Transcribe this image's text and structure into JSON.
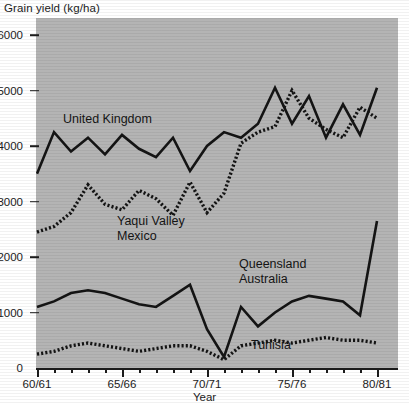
{
  "chart_data": {
    "type": "line",
    "title": "",
    "ylabel": "Grain yield (kg/ha)",
    "xlabel": "Year",
    "ylim": [
      0,
      6000
    ],
    "ytick_labels": [
      "0",
      "1000",
      "2000",
      "3000",
      "4000",
      "5000",
      "6000"
    ],
    "ytick_values": [
      0,
      1000,
      2000,
      3000,
      4000,
      5000,
      6000
    ],
    "xtick_labels": [
      "60/61",
      "65/66",
      "70/71",
      "75/76",
      "80/81"
    ],
    "xtick_values": [
      1960,
      1965,
      1970,
      1975,
      1980
    ],
    "xlim": [
      1960,
      1981
    ],
    "grid": false,
    "legend": "inline-annotations",
    "x": [
      1960,
      1961,
      1962,
      1963,
      1964,
      1965,
      1966,
      1967,
      1968,
      1969,
      1970,
      1971,
      1972,
      1973,
      1974,
      1975,
      1976,
      1977,
      1978,
      1979,
      1980
    ],
    "series": [
      {
        "name": "United Kingdom",
        "style": "solid",
        "color": "#141414",
        "label_position": {
          "x": 63,
          "y": 118
        },
        "values": [
          3500,
          4250,
          3900,
          4150,
          3850,
          4200,
          3950,
          3800,
          4150,
          3550,
          4000,
          4250,
          4150,
          4400,
          5050,
          4400,
          4900,
          4150,
          4750,
          4200,
          5050
        ]
      },
      {
        "name": "Yaqui Valley Mexico",
        "style": "dotted",
        "color": "#141414",
        "label_position": {
          "x": 117,
          "y": 216
        },
        "values": [
          2450,
          2550,
          2800,
          3300,
          2950,
          2850,
          3200,
          3050,
          2750,
          3350,
          2800,
          3150,
          4050,
          4250,
          4350,
          5000,
          4500,
          4300,
          4150,
          4700,
          4500
        ]
      },
      {
        "name": "Queensland Australia",
        "style": "solid",
        "color": "#141414",
        "label_position": {
          "x": 239,
          "y": 258
        },
        "values": [
          1100,
          1200,
          1350,
          1400,
          1350,
          1250,
          1150,
          1100,
          1300,
          1500,
          700,
          200,
          1100,
          750,
          1000,
          1200,
          1300,
          1250,
          1200,
          950,
          2650
        ]
      },
      {
        "name": "Tunisia",
        "style": "dotted",
        "color": "#141414",
        "label_position": {
          "x": 251,
          "y": 339
        },
        "values": [
          250,
          300,
          400,
          450,
          400,
          350,
          300,
          350,
          400,
          400,
          300,
          150,
          400,
          450,
          500,
          450,
          500,
          550,
          500,
          500,
          450
        ]
      }
    ]
  },
  "axes": {
    "y_title": "Grain yield (kg/ha)",
    "x_title": "Year"
  },
  "labels": {
    "uk_line1": "United Kingdom",
    "yaqui_line1": "Yaqui Valley",
    "yaqui_line2": "Mexico",
    "queensland_line1": "Queensland",
    "queensland_line2": "Australia",
    "tunisia_line1": "Tunisia"
  },
  "colors": {
    "plot_background": "#b4b4b4",
    "page_background": "#ffffff",
    "ink": "#141414"
  }
}
